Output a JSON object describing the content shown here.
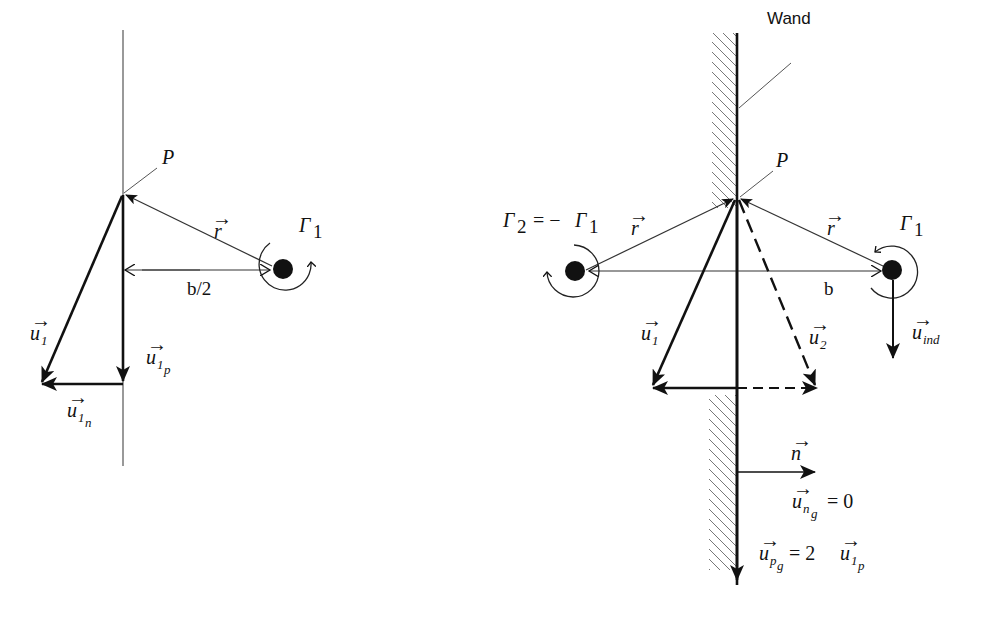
{
  "figure": {
    "left_panel": {
      "point_label": "P",
      "vortex_label": "Γ",
      "vortex_sub": "1",
      "r_label": "r",
      "distance_label": "b/2",
      "u1_label": "u",
      "u1_sub": "1",
      "u1p_label": "u",
      "u1p_sub": "1",
      "u1p_subsub": "p",
      "u1n_label": "u",
      "u1n_sub": "1",
      "u1n_subsub": "n"
    },
    "right_panel": {
      "wall_label": "Wand",
      "point_label": "P",
      "vortex1_label": "Γ",
      "vortex1_sub": "1",
      "vortex2_label": "Γ",
      "vortex2_sub": "2",
      "vortex2_eq": " = −",
      "vortex2_rhs": "Γ",
      "vortex2_rhs_sub": "1",
      "r_left_label": "r",
      "r_right_label": "r",
      "distance_label": "b",
      "u1_label": "u",
      "u1_sub": "1",
      "u2_label": "u",
      "u2_sub": "2",
      "uind_label": "u",
      "uind_sub": "ind",
      "n_label": "n",
      "ung_label": "u",
      "ung_sub": "n",
      "ung_subsub": "g",
      "ung_rhs": " = 0",
      "upg_label": "u",
      "upg_sub": "p",
      "upg_subsub": "g",
      "upg_rhs": " = 2",
      "upg_rhs_u": "u",
      "upg_rhs_sub": "1",
      "upg_rhs_subsub": "p"
    },
    "vector_arrow": "→"
  }
}
